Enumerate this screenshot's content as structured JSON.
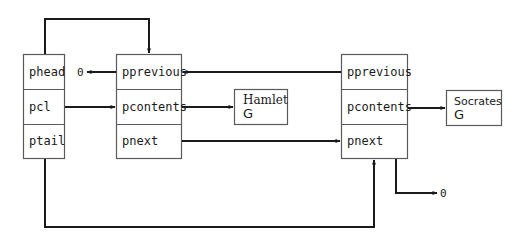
{
  "diagram": {
    "type": "doubly-linked-list",
    "colors": {
      "line": "#1a1a1a",
      "box_border": "#5a5a5a",
      "background": "#ffffff"
    },
    "list_header": {
      "fields": [
        {
          "name": "phead"
        },
        {
          "name": "pcl"
        },
        {
          "name": "ptail"
        }
      ]
    },
    "nodes": [
      {
        "fields": [
          {
            "name": "pprevious"
          },
          {
            "name": "pcontents"
          },
          {
            "name": "pnext"
          }
        ],
        "contents": {
          "line1": "Hamlet",
          "line2": "G"
        }
      },
      {
        "fields": [
          {
            "name": "pprevious"
          },
          {
            "name": "pcontents"
          },
          {
            "name": "pnext"
          }
        ],
        "contents": {
          "line1": "Socrates",
          "line2": "G"
        }
      }
    ],
    "null_markers": [
      {
        "label": "0"
      },
      {
        "label": "0"
      }
    ],
    "edges": [
      {
        "from": "list_header.phead",
        "to": "nodes.0"
      },
      {
        "from": "list_header.pcl",
        "to": "nodes.0.pcontents"
      },
      {
        "from": "list_header.ptail",
        "to": "nodes.1"
      },
      {
        "from": "nodes.0.pprevious",
        "to": "null"
      },
      {
        "from": "nodes.0.pcontents",
        "to": "Hamlet"
      },
      {
        "from": "nodes.0.pnext",
        "to": "nodes.1.pnext"
      },
      {
        "from": "nodes.1.pprevious",
        "to": "nodes.0.pprevious"
      },
      {
        "from": "nodes.1.pcontents",
        "to": "Socrates"
      },
      {
        "from": "nodes.1.pnext",
        "to": "null"
      }
    ]
  }
}
